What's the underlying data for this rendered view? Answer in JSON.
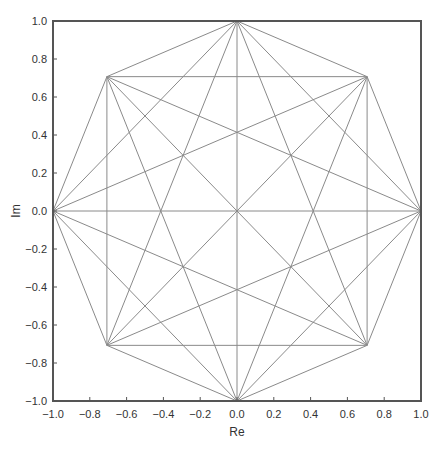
{
  "chart_data": {
    "type": "line",
    "title": "",
    "xlabel": "Re",
    "ylabel": "Im",
    "xlim": [
      -1.0,
      1.0
    ],
    "ylim": [
      -1.0,
      1.0
    ],
    "grid": false,
    "legend": null,
    "x_ticks": [
      "−1.0",
      "−0.8",
      "−0.6",
      "−0.4",
      "−0.2",
      "0.0",
      "0.2",
      "0.4",
      "0.6",
      "0.8",
      "1.0"
    ],
    "y_ticks": [
      "1.0",
      "0.8",
      "0.6",
      "0.4",
      "0.2",
      "0.0",
      "−0.2",
      "−0.4",
      "−0.6",
      "−0.8",
      "−1.0"
    ],
    "vertices": [
      {
        "re": 1.0,
        "im": 0.0
      },
      {
        "re": 0.7071,
        "im": 0.7071
      },
      {
        "re": 0.0,
        "im": 1.0
      },
      {
        "re": -0.7071,
        "im": 0.7071
      },
      {
        "re": -1.0,
        "im": 0.0
      },
      {
        "re": -0.7071,
        "im": -0.7071
      },
      {
        "re": 0.0,
        "im": -1.0
      },
      {
        "re": 0.7071,
        "im": -0.7071
      }
    ],
    "line_color": "#8a8a8a",
    "frame_color": "#555555"
  }
}
